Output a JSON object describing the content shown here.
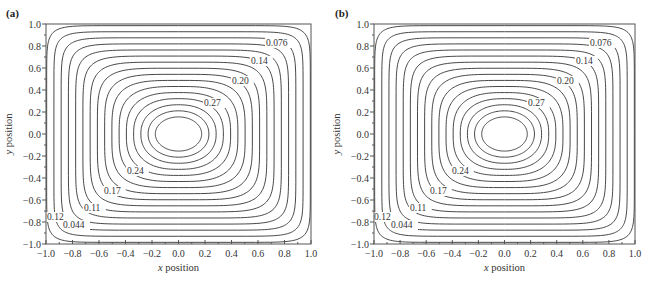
{
  "chart_data": [
    {
      "type": "contour",
      "panel_label": "(a)",
      "xlabel_var": "x",
      "xlabel_rest": " position",
      "ylabel_var": "y",
      "ylabel_rest": " position",
      "xlim": [
        -1.0,
        1.0
      ],
      "ylim": [
        -1.0,
        1.0
      ],
      "xticks": [
        "-1.0",
        "-0.8",
        "-0.6",
        "-0.4",
        "-0.2",
        "0.0",
        "0.2",
        "0.4",
        "0.6",
        "0.8",
        "1.0"
      ],
      "yticks": [
        "1.0",
        "0.8",
        "0.6",
        "0.4",
        "0.2",
        "0.0",
        "-0.2",
        "-0.4",
        "-0.6",
        "-0.8",
        "-1.0"
      ],
      "contour_levels_labeled": [
        "0.076",
        "0.14",
        "0.20",
        "0.27",
        "0.24",
        "0.17",
        "0.11",
        "0.12",
        "0.044"
      ],
      "contour_count": 16,
      "center": [
        0.0,
        0.0
      ],
      "grid": false
    },
    {
      "type": "contour",
      "panel_label": "(b)",
      "xlabel_var": "x",
      "xlabel_rest": " position",
      "ylabel_var": "y",
      "ylabel_rest": " position",
      "xlim": [
        -1.0,
        1.0
      ],
      "ylim": [
        -1.0,
        1.0
      ],
      "xticks": [
        "-1.0",
        "-0.8",
        "-0.6",
        "-0.4",
        "-0.2",
        "0.0",
        "0.2",
        "0.4",
        "0.6",
        "0.8",
        "1.0"
      ],
      "yticks": [
        "1.0",
        "0.8",
        "0.6",
        "0.4",
        "0.2",
        "0.0",
        "-0.2",
        "-0.4",
        "-0.6",
        "-0.8",
        "-1.0"
      ],
      "contour_levels_labeled": [
        "0.076",
        "0.14",
        "0.20",
        "0.27",
        "0.24",
        "0.17",
        "0.11",
        "0.12",
        "0.044"
      ],
      "contour_count": 16,
      "center": [
        0.0,
        0.0
      ],
      "grid": false
    }
  ],
  "panels": [
    {
      "label": "(a)",
      "frame": {
        "left": 46,
        "top": 24,
        "right": 311,
        "bottom": 244
      },
      "label_pos": {
        "x": 6,
        "y": 17
      },
      "contour_labels": [
        {
          "text": "0.076",
          "x": 266,
          "y": 46
        },
        {
          "text": "0.14",
          "x": 251,
          "y": 64
        },
        {
          "text": "0.20",
          "x": 232,
          "y": 84
        },
        {
          "text": "0.27",
          "x": 204,
          "y": 106
        },
        {
          "text": "0.24",
          "x": 127,
          "y": 174
        },
        {
          "text": "0.17",
          "x": 104,
          "y": 194
        },
        {
          "text": "0.11",
          "x": 84,
          "y": 211
        },
        {
          "text": "0.12",
          "x": 47,
          "y": 220
        },
        {
          "text": "0.044",
          "x": 63,
          "y": 228
        }
      ]
    },
    {
      "label": "(b)",
      "frame": {
        "left": 374,
        "top": 24,
        "right": 635,
        "bottom": 244
      },
      "label_pos": {
        "x": 335,
        "y": 17
      },
      "contour_labels": [
        {
          "text": "0.076",
          "x": 590,
          "y": 46
        },
        {
          "text": "0.14",
          "x": 576,
          "y": 64
        },
        {
          "text": "0.20",
          "x": 557,
          "y": 84
        },
        {
          "text": "0.27",
          "x": 528,
          "y": 106
        },
        {
          "text": "0.24",
          "x": 452,
          "y": 174
        },
        {
          "text": "0.17",
          "x": 430,
          "y": 194
        },
        {
          "text": "0.11",
          "x": 410,
          "y": 211
        },
        {
          "text": "0.12",
          "x": 374,
          "y": 220
        },
        {
          "text": "0.044",
          "x": 391,
          "y": 228
        }
      ]
    }
  ]
}
